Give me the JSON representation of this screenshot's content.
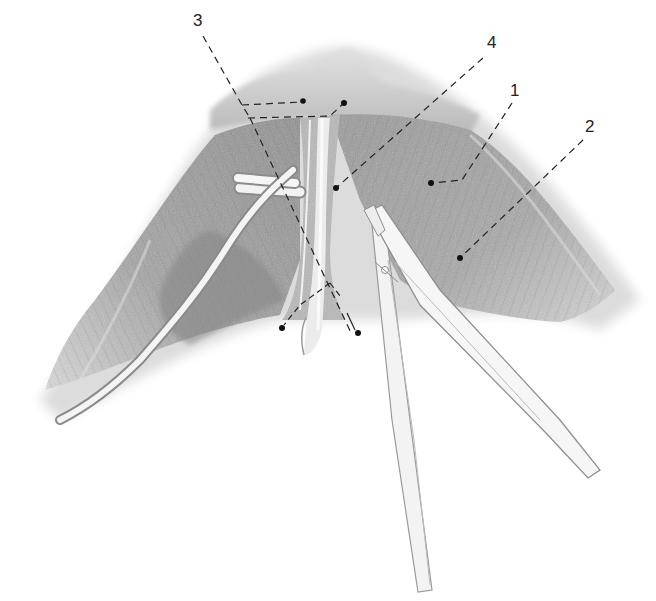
{
  "figure": {
    "type": "anatomical-surgical-illustration",
    "colors": {
      "background": "#ffffff",
      "tissue_dark": "#8c8c8c",
      "tissue_mid": "#aaaaaa",
      "tissue_light": "#cfcfcf",
      "instrument": "#f4f4f4",
      "leader": "#222222"
    },
    "labels": [
      {
        "id": "1",
        "text": "1",
        "x": 510,
        "y": 98
      },
      {
        "id": "2",
        "text": "2",
        "x": 585,
        "y": 133
      },
      {
        "id": "3",
        "text": "3",
        "x": 195,
        "y": 24
      },
      {
        "id": "4",
        "text": "4",
        "x": 487,
        "y": 47
      }
    ],
    "elements": [
      {
        "name": "muscle-tissue",
        "desc": "fan-shaped muscle with striations"
      },
      {
        "name": "central-ligament",
        "desc": "vertical light band in center"
      },
      {
        "name": "vessel-loop",
        "desc": "crossing white tubes on left (vessel loop retractor)"
      },
      {
        "name": "forceps",
        "desc": "surgical forceps/clamp entering from lower right"
      }
    ]
  }
}
